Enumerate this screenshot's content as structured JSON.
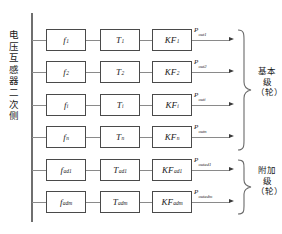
{
  "diagram": {
    "left_bus_label": "电压互感器二次侧",
    "colors": {
      "box_border": "#4a4a4a",
      "line": "#8a8a8a",
      "bus": "#6f6f6f",
      "arrow": "#3a3a3a",
      "text": "#1a1a1a",
      "background": "#ffffff"
    },
    "rows": [
      {
        "id": "row-1",
        "f": "f",
        "f_sub": "1",
        "t": "T",
        "t_sub": "1",
        "kf": "KF",
        "kf_sub": "1",
        "p": "P",
        "p_sub": "out1",
        "group": "basic"
      },
      {
        "id": "row-2",
        "f": "f",
        "f_sub": "2",
        "t": "T",
        "t_sub": "2",
        "kf": "KF",
        "kf_sub": "2",
        "p": "P",
        "p_sub": "out2",
        "group": "basic"
      },
      {
        "id": "row-i",
        "f": "f",
        "f_sub": "i",
        "t": "T",
        "t_sub": "i",
        "kf": "KF",
        "kf_sub": "i",
        "p": "P",
        "p_sub": "outi",
        "group": "basic"
      },
      {
        "id": "row-n",
        "f": "f",
        "f_sub": "n",
        "t": "T",
        "t_sub": "n",
        "kf": "KF",
        "kf_sub": "n",
        "p": "P",
        "p_sub": "outn",
        "group": "basic"
      },
      {
        "id": "row-ad1",
        "f": "f",
        "f_sub": "ad1",
        "t": "T",
        "t_sub": "ad1",
        "kf": "KF",
        "kf_sub": "ad1",
        "p": "P",
        "p_sub": "outad1",
        "group": "additional"
      },
      {
        "id": "row-adm",
        "f": "f",
        "f_sub": "adm",
        "t": "T",
        "t_sub": "adm",
        "kf": "KF",
        "kf_sub": "adm",
        "p": "P",
        "p_sub": "outadm",
        "group": "additional"
      }
    ],
    "groups": [
      {
        "id": "basic",
        "label": "基本级（轮）",
        "rows": 4
      },
      {
        "id": "additional",
        "label": "附加级（轮）",
        "rows": 2
      }
    ]
  }
}
